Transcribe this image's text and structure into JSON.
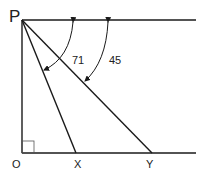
{
  "diagram": {
    "points": {
      "P": {
        "label": "P"
      },
      "O": {
        "label": "O"
      },
      "X": {
        "label": "X"
      },
      "Y": {
        "label": "Y"
      }
    },
    "angles": [
      {
        "label": "71",
        "between": [
          "horizontal-from-P",
          "PX"
        ]
      },
      {
        "label": "45",
        "between": [
          "horizontal-from-P",
          "PY"
        ]
      }
    ],
    "right_angle_at": "O",
    "line_color": "#1a1a1a"
  }
}
